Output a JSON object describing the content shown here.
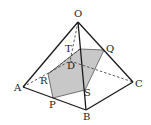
{
  "figure": {
    "colors": {
      "edge": "#1a1a1a",
      "hidden": "#333333",
      "section_fill": "#c8c8c8"
    },
    "labels": {
      "O": "O",
      "A": "A",
      "B": "B",
      "C": "C",
      "D": "D",
      "P": "P",
      "Q": "Q",
      "R": "R",
      "S": "S",
      "T": "T"
    },
    "points": {
      "O": [
        78,
        22
      ],
      "A": [
        23,
        87
      ],
      "B": [
        86,
        110
      ],
      "C": [
        133,
        82
      ],
      "D": [
        70,
        61
      ],
      "P": [
        53,
        98
      ],
      "Q": [
        104,
        50
      ],
      "R": [
        48,
        74
      ],
      "S": [
        85,
        90
      ],
      "T": [
        80,
        49
      ]
    }
  }
}
